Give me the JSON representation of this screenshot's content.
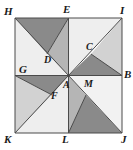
{
  "figure": {
    "name": "pinwheel-square-dissection",
    "canvas": {
      "width": 133,
      "height": 150
    },
    "square": {
      "left": 15,
      "top": 18,
      "size": 107
    },
    "colors": {
      "background": "#ffffff",
      "outline": "#4a4a4a",
      "dark_gray": "#8a8a8a",
      "mid_gray": "#b5b5b5",
      "light_gray": "#d2d2d2",
      "pale_gray": "#e7e7e7",
      "label": "#1a1a1a"
    },
    "points": {
      "H": {
        "x": 15,
        "y": 18,
        "label": "H"
      },
      "E": {
        "x": 68.5,
        "y": 18,
        "label": "E"
      },
      "I": {
        "x": 122,
        "y": 18,
        "label": "I"
      },
      "G": {
        "x": 15,
        "y": 75.5,
        "label": "G"
      },
      "A": {
        "x": 68.5,
        "y": 75.5,
        "label": "A"
      },
      "B": {
        "x": 122,
        "y": 75.5,
        "label": "B"
      },
      "K": {
        "x": 15,
        "y": 133,
        "label": "K"
      },
      "L": {
        "x": 68.5,
        "y": 133,
        "label": "L"
      },
      "J": {
        "x": 122,
        "y": 133,
        "label": "J"
      },
      "D": {
        "x": 47,
        "y": 54,
        "label": "D"
      },
      "C": {
        "x": 91,
        "y": 54,
        "label": "C"
      },
      "F": {
        "x": 52,
        "y": 95,
        "label": "F"
      },
      "M": {
        "x": 86,
        "y": 95,
        "label": "M"
      }
    },
    "labels": [
      {
        "id": "H",
        "text": "H",
        "x": 4,
        "y": 6,
        "anchor": "vertex-label-h"
      },
      {
        "id": "E",
        "text": "E",
        "x": 63,
        "y": 4,
        "anchor": "vertex-label-e"
      },
      {
        "id": "I",
        "text": "I",
        "x": 120,
        "y": 5,
        "anchor": "vertex-label-i"
      },
      {
        "id": "G",
        "text": "G",
        "x": 19,
        "y": 64,
        "anchor": "vertex-label-g"
      },
      {
        "id": "B",
        "text": "B",
        "x": 124,
        "y": 69,
        "anchor": "vertex-label-b"
      },
      {
        "id": "K",
        "text": "K",
        "x": 4,
        "y": 134,
        "anchor": "vertex-label-k"
      },
      {
        "id": "L",
        "text": "L",
        "x": 62,
        "y": 134,
        "anchor": "vertex-label-l"
      },
      {
        "id": "J",
        "text": "J",
        "x": 121,
        "y": 134,
        "anchor": "vertex-label-j"
      },
      {
        "id": "D",
        "text": "D",
        "x": 44,
        "y": 55,
        "anchor": "inner-label-d"
      },
      {
        "id": "C",
        "text": "C",
        "x": 86,
        "y": 42,
        "anchor": "inner-label-c"
      },
      {
        "id": "A",
        "text": "A",
        "x": 63,
        "y": 80,
        "anchor": "inner-label-a"
      },
      {
        "id": "F",
        "text": "F",
        "x": 51,
        "y": 91,
        "anchor": "inner-label-f"
      },
      {
        "id": "M",
        "text": "M",
        "x": 84,
        "y": 79,
        "anchor": "inner-label-m"
      }
    ],
    "regions": [
      {
        "id": "tl-dark",
        "name": "triangle-H-E-D",
        "fill": "#8a8a8a",
        "points": "15,18 68.5,18 47,54"
      },
      {
        "id": "tl-mid",
        "name": "triangle-E-A-D",
        "fill": "#b5b5b5",
        "points": "68.5,18 68.5,75.5 47,54"
      },
      {
        "id": "tl-pale",
        "name": "triangle-H-D-A-G",
        "fill": "#eeeeee",
        "points": "15,18 47,54 68.5,75.5 15,75.5"
      },
      {
        "id": "tr-pale",
        "name": "triangle-E-I-A",
        "fill": "#eeeeee",
        "points": "68.5,18 122,18 68.5,75.5"
      },
      {
        "id": "tr-light",
        "name": "triangle-I-B-C",
        "fill": "#d2d2d2",
        "points": "122,18 122,75.5 91,54"
      },
      {
        "id": "tr-dark",
        "name": "triangle-A-C-B",
        "fill": "#8a8a8a",
        "points": "68.5,75.5 91,54 122,75.5"
      },
      {
        "id": "bl-dark",
        "name": "triangle-G-A-F",
        "fill": "#8a8a8a",
        "points": "15,75.5 68.5,75.5 52,95"
      },
      {
        "id": "bl-light",
        "name": "triangle-G-F-K",
        "fill": "#d2d2d2",
        "points": "15,75.5 52,95 15,133"
      },
      {
        "id": "bl-pale",
        "name": "triangle-K-F-A-L",
        "fill": "#eeeeee",
        "points": "15,133 52,95 68.5,75.5 68.5,133"
      },
      {
        "id": "br-light",
        "name": "triangle-A-M-L",
        "fill": "#b5b5b5",
        "points": "68.5,75.5 86,95 68.5,133"
      },
      {
        "id": "br-dark",
        "name": "triangle-L-M-J",
        "fill": "#8a8a8a",
        "points": "68.5,133 86,95 122,133"
      },
      {
        "id": "br-pale",
        "name": "triangle-A-B-J-M",
        "fill": "#f2f2f2",
        "points": "68.5,75.5 122,75.5 122,133 86,95"
      }
    ],
    "segments": [
      {
        "name": "edge-H-I",
        "x1": 15,
        "y1": 18,
        "x2": 122,
        "y2": 18
      },
      {
        "name": "edge-I-J",
        "x1": 122,
        "y1": 18,
        "x2": 122,
        "y2": 133
      },
      {
        "name": "edge-J-K",
        "x1": 122,
        "y1": 133,
        "x2": 15,
        "y2": 133
      },
      {
        "name": "edge-K-H",
        "x1": 15,
        "y1": 133,
        "x2": 15,
        "y2": 18
      },
      {
        "name": "median-E-L",
        "x1": 68.5,
        "y1": 18,
        "x2": 68.5,
        "y2": 133
      },
      {
        "name": "median-G-B",
        "x1": 15,
        "y1": 75.5,
        "x2": 122,
        "y2": 75.5
      },
      {
        "name": "diagonal-H-A",
        "x1": 15,
        "y1": 18,
        "x2": 68.5,
        "y2": 75.5
      },
      {
        "name": "diagonal-A-I",
        "x1": 68.5,
        "y1": 75.5,
        "x2": 122,
        "y2": 18
      },
      {
        "name": "diagonal-A-K",
        "x1": 68.5,
        "y1": 75.5,
        "x2": 15,
        "y2": 133
      },
      {
        "name": "diagonal-A-J",
        "x1": 68.5,
        "y1": 75.5,
        "x2": 122,
        "y2": 133
      },
      {
        "name": "cevian-E-D",
        "x1": 68.5,
        "y1": 18,
        "x2": 47,
        "y2": 54
      },
      {
        "name": "cevian-C-B",
        "x1": 91,
        "y1": 54,
        "x2": 122,
        "y2": 75.5
      },
      {
        "name": "cevian-G-F",
        "x1": 15,
        "y1": 75.5,
        "x2": 52,
        "y2": 95
      },
      {
        "name": "cevian-M-L",
        "x1": 86,
        "y1": 95,
        "x2": 68.5,
        "y2": 133
      }
    ]
  }
}
